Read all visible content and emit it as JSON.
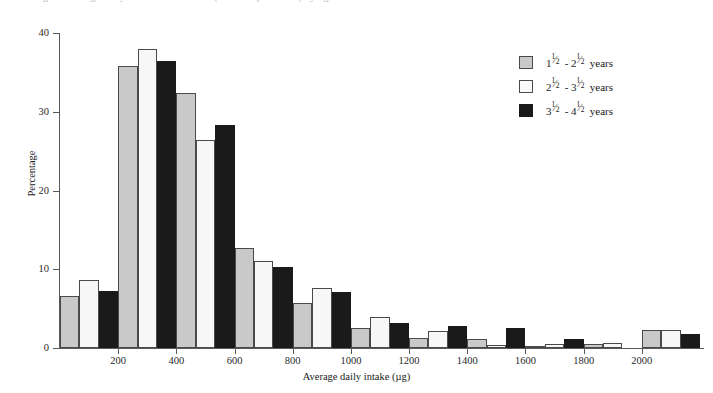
{
  "top_cut_text": "Figure  Average daily intake of vitamin A (retinol equivalents) by age of child",
  "chart_data": {
    "type": "bar",
    "title": "",
    "subtitle": "",
    "xlabel": "Average daily intake (µg)",
    "ylabel": "Percentage",
    "xlim": [
      0,
      2200
    ],
    "ylim": [
      0,
      40
    ],
    "grid": false,
    "legend_position": "top-right",
    "x_ticks": [
      200,
      400,
      600,
      800,
      1000,
      1200,
      1400,
      1600,
      1800,
      2000
    ],
    "x_tick_labels": [
      "200",
      "400",
      "600",
      "800",
      "1000",
      "1200",
      "1400",
      "1600",
      "1800",
      "2000"
    ],
    "y_ticks": [
      0,
      10,
      20,
      30,
      40
    ],
    "y_tick_labels": [
      "0",
      "10",
      "20",
      "30",
      "40"
    ],
    "bin_width": 200,
    "bin_starts": [
      0,
      200,
      400,
      600,
      800,
      1000,
      1200,
      1400,
      1600,
      1800,
      2000
    ],
    "categories": [
      "0-200",
      "200-400",
      "400-600",
      "600-800",
      "800-1000",
      "1000-1200",
      "1200-1400",
      "1400-1600",
      "1600-1800",
      "1800-2000",
      "2000-2200"
    ],
    "series": [
      {
        "name": "1½ - 2½ years",
        "legend_parts": {
          "whole1": "1",
          "num1": "1",
          "den1": "2",
          "dash": "-",
          "whole2": "2",
          "num2": "1",
          "den2": "2",
          "unit": "years"
        },
        "color": "#c9c9c9",
        "values": [
          6.6,
          35.8,
          32.4,
          12.7,
          5.7,
          2.6,
          1.3,
          1.2,
          0.2,
          0.5,
          2.3
        ]
      },
      {
        "name": "2½ - 3½ years",
        "legend_parts": {
          "whole1": "2",
          "num1": "1",
          "den1": "2",
          "dash": "-",
          "whole2": "3",
          "num2": "1",
          "den2": "2",
          "unit": "years"
        },
        "color": "#f7f7f7",
        "values": [
          8.7,
          38.0,
          26.4,
          11.0,
          7.6,
          3.9,
          2.1,
          0.4,
          0.5,
          0.6,
          2.3
        ]
      },
      {
        "name": "3½ - 4½ years",
        "legend_parts": {
          "whole1": "3",
          "num1": "1",
          "den1": "2",
          "dash": "-",
          "whole2": "4",
          "num2": "1",
          "den2": "2",
          "unit": "years"
        },
        "color": "#1a1a1a",
        "values": [
          7.3,
          36.5,
          28.3,
          10.3,
          7.1,
          3.2,
          2.8,
          2.5,
          1.2,
          0.0,
          1.8
        ]
      }
    ]
  }
}
